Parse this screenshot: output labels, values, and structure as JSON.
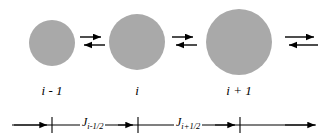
{
  "figure": {
    "background_color": "#ffffff",
    "line_color": "#000000",
    "particle_color": "#a9a9a9"
  },
  "particles": [
    {
      "id": "particle-i-minus-1",
      "cx": 52,
      "cy": 43,
      "r": 23
    },
    {
      "id": "particle-i",
      "cx": 137,
      "cy": 42,
      "r": 28
    },
    {
      "id": "particle-i-plus-1",
      "cx": 239,
      "cy": 42,
      "r": 33
    }
  ],
  "equilibrium_arrows": [
    {
      "id": "arrows-left",
      "x": 80,
      "y": 36,
      "width": 25,
      "label": "reversible-exchange"
    },
    {
      "id": "arrows-middle",
      "x": 172,
      "y": 36,
      "width": 25,
      "label": "reversible-exchange"
    },
    {
      "id": "arrows-right",
      "x": 285,
      "y": 36,
      "width": 32,
      "label": "reversible-exchange"
    }
  ],
  "node_labels": [
    {
      "id": "label-i-minus-1",
      "text": "i - 1",
      "cx": 52,
      "y": 84
    },
    {
      "id": "label-i",
      "text": "i",
      "cx": 137,
      "y": 84
    },
    {
      "id": "label-i-plus-1",
      "text": "i + 1",
      "cx": 239,
      "y": 84
    }
  ],
  "axis": {
    "y": 125,
    "x_start": 12,
    "x_end": 316,
    "tick_half_height": 8,
    "ticks": [
      52,
      138,
      240
    ]
  },
  "flux_labels": [
    {
      "id": "flux-i-minus-half",
      "symbol": "J",
      "subscript": "i-1/2",
      "cx": 95,
      "y": 118,
      "segment_start": 52,
      "segment_end": 138
    },
    {
      "id": "flux-i-plus-half",
      "symbol": "J",
      "subscript": "i+1/2",
      "cx": 189,
      "y": 118,
      "segment_start": 138,
      "segment_end": 240
    }
  ]
}
